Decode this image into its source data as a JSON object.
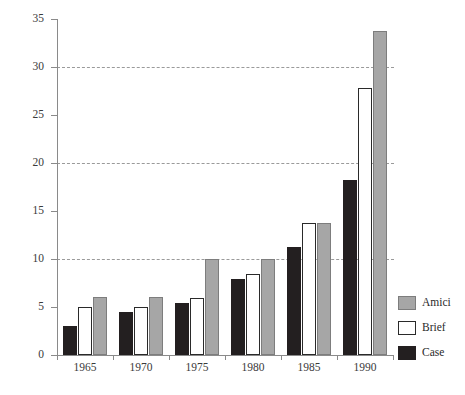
{
  "chart_data": {
    "type": "bar",
    "title": "",
    "subtitle": "",
    "xlabel": "",
    "ylabel": "",
    "categories": [
      "1965",
      "1970",
      "1975",
      "1980",
      "1985",
      "1990"
    ],
    "series": [
      {
        "name": "Case",
        "color": "#231f20",
        "values": [
          3.0,
          4.5,
          5.4,
          7.9,
          11.3,
          18.2
        ]
      },
      {
        "name": "Brief",
        "color": "#ffffff",
        "values": [
          5.0,
          5.0,
          5.9,
          8.4,
          13.8,
          27.8
        ]
      },
      {
        "name": "Amici",
        "color": "#a6a6a6",
        "values": [
          6.0,
          6.0,
          10.0,
          10.0,
          13.8,
          33.7
        ]
      }
    ],
    "series_order_in_plot": [
      "Case",
      "Brief",
      "Amici"
    ],
    "ylim": [
      0,
      35
    ],
    "ytick_values": [
      0,
      5,
      10,
      15,
      20,
      25,
      30,
      35
    ],
    "ytick_labels": [
      "0",
      "5",
      "10",
      "15",
      "20",
      "25",
      "30",
      "35"
    ],
    "gridlines_at": [
      10,
      20,
      30
    ],
    "grid": "horizontal-dashed",
    "legend_position": "right-bottom",
    "legend_entries": [
      "Amici",
      "Brief",
      "Case"
    ]
  },
  "legend": {
    "items": [
      {
        "label": "Amici",
        "swatch": "amici"
      },
      {
        "label": "Brief",
        "swatch": "brief"
      },
      {
        "label": "Case",
        "swatch": "case"
      }
    ]
  }
}
